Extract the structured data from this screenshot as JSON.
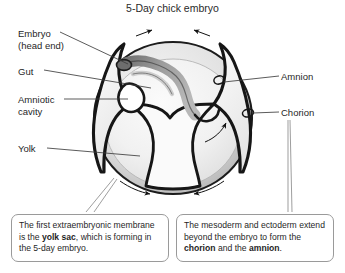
{
  "figure": {
    "title": "5-Day chick embryo",
    "type": "biological-cross-section-diagram"
  },
  "labels": [
    {
      "id": "embryo",
      "line1": "Embryo",
      "line2": "(head end)",
      "side": "left"
    },
    {
      "id": "gut",
      "line1": "Gut",
      "line2": "",
      "side": "left"
    },
    {
      "id": "amniotic_cavity",
      "line1": "Amniotic",
      "line2": "cavity",
      "side": "left"
    },
    {
      "id": "yolk",
      "line1": "Yolk",
      "line2": "",
      "side": "left"
    },
    {
      "id": "amnion",
      "line1": "Amnion",
      "line2": "",
      "side": "right"
    },
    {
      "id": "chorion",
      "line1": "Chorion",
      "line2": "",
      "side": "right"
    }
  ],
  "callouts": {
    "left": {
      "segments": [
        {
          "text": "The first extraembryonic ",
          "bold": false
        },
        {
          "text": "membrane is the ",
          "bold": false
        },
        {
          "text": "yolk sac",
          "bold": true
        },
        {
          "text": ", which ",
          "bold": false
        },
        {
          "text": "is forming in the 5-day embryo.",
          "bold": false
        }
      ],
      "plain": "The first extraembryonic membrane is the yolk sac, which is forming in the 5-day embryo."
    },
    "right": {
      "segments": [
        {
          "text": "The mesoderm and ectoderm ",
          "bold": false
        },
        {
          "text": "extend beyond the embryo to form ",
          "bold": false
        },
        {
          "text": "the ",
          "bold": false
        },
        {
          "text": "chorion",
          "bold": true
        },
        {
          "text": " and the ",
          "bold": false
        },
        {
          "text": "amnion",
          "bold": true
        },
        {
          "text": ".",
          "bold": false
        }
      ],
      "plain": "The mesoderm and ectoderm extend beyond the embryo to form the chorion and the amnion."
    }
  },
  "annotations": {
    "arrows_top": "two converging arrows above the amniotic folds, pointing toward each other",
    "arrow_middle_right": "curved arrow inside the egg pointing up and to the right",
    "arrows_bottom": "two converging arrows along the lower yolk sac rim, pointing toward each other"
  },
  "colors": {
    "outline": "#1a1a1a",
    "background": "#ffffff",
    "yolk_fill": "#f2f2f2",
    "yolk_rim": "#cfcfcf",
    "membrane_band": "#d8d8d8",
    "embryo_body": "#8e8e8e",
    "callout_border": "#9a9a9a",
    "leader_line": "#555555",
    "text": "#1f1f1f"
  }
}
